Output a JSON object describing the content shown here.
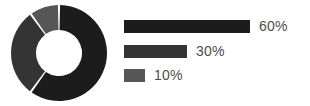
{
  "chart_data": {
    "type": "pie",
    "title": "",
    "subtitle": "",
    "xlabel": "",
    "ylabel": "",
    "variant": "donut",
    "legend_position": "right",
    "grid": false,
    "categories": [
      "60%",
      "30%",
      "10%"
    ],
    "values": [
      60,
      30,
      10
    ],
    "labels": [
      "60%",
      "30%",
      "10%"
    ],
    "slice_colors": [
      "#1c1c1c",
      "#343434",
      "#565656"
    ],
    "slice_gap_color": "#ffffff",
    "start_angle_deg": 0,
    "direction": "clockwise",
    "inner_radius_ratio": 0.48,
    "legend": [
      {
        "label": "60%",
        "value": 60,
        "color": "#1c1c1c",
        "bar_width_px": 126
      },
      {
        "label": "30%",
        "value": 30,
        "color": "#343434",
        "bar_width_px": 63
      },
      {
        "label": "10%",
        "value": 10,
        "color": "#565656",
        "bar_width_px": 21
      }
    ]
  },
  "figure": {
    "background": "#ffffff",
    "label_color": "#4d4d4d"
  }
}
